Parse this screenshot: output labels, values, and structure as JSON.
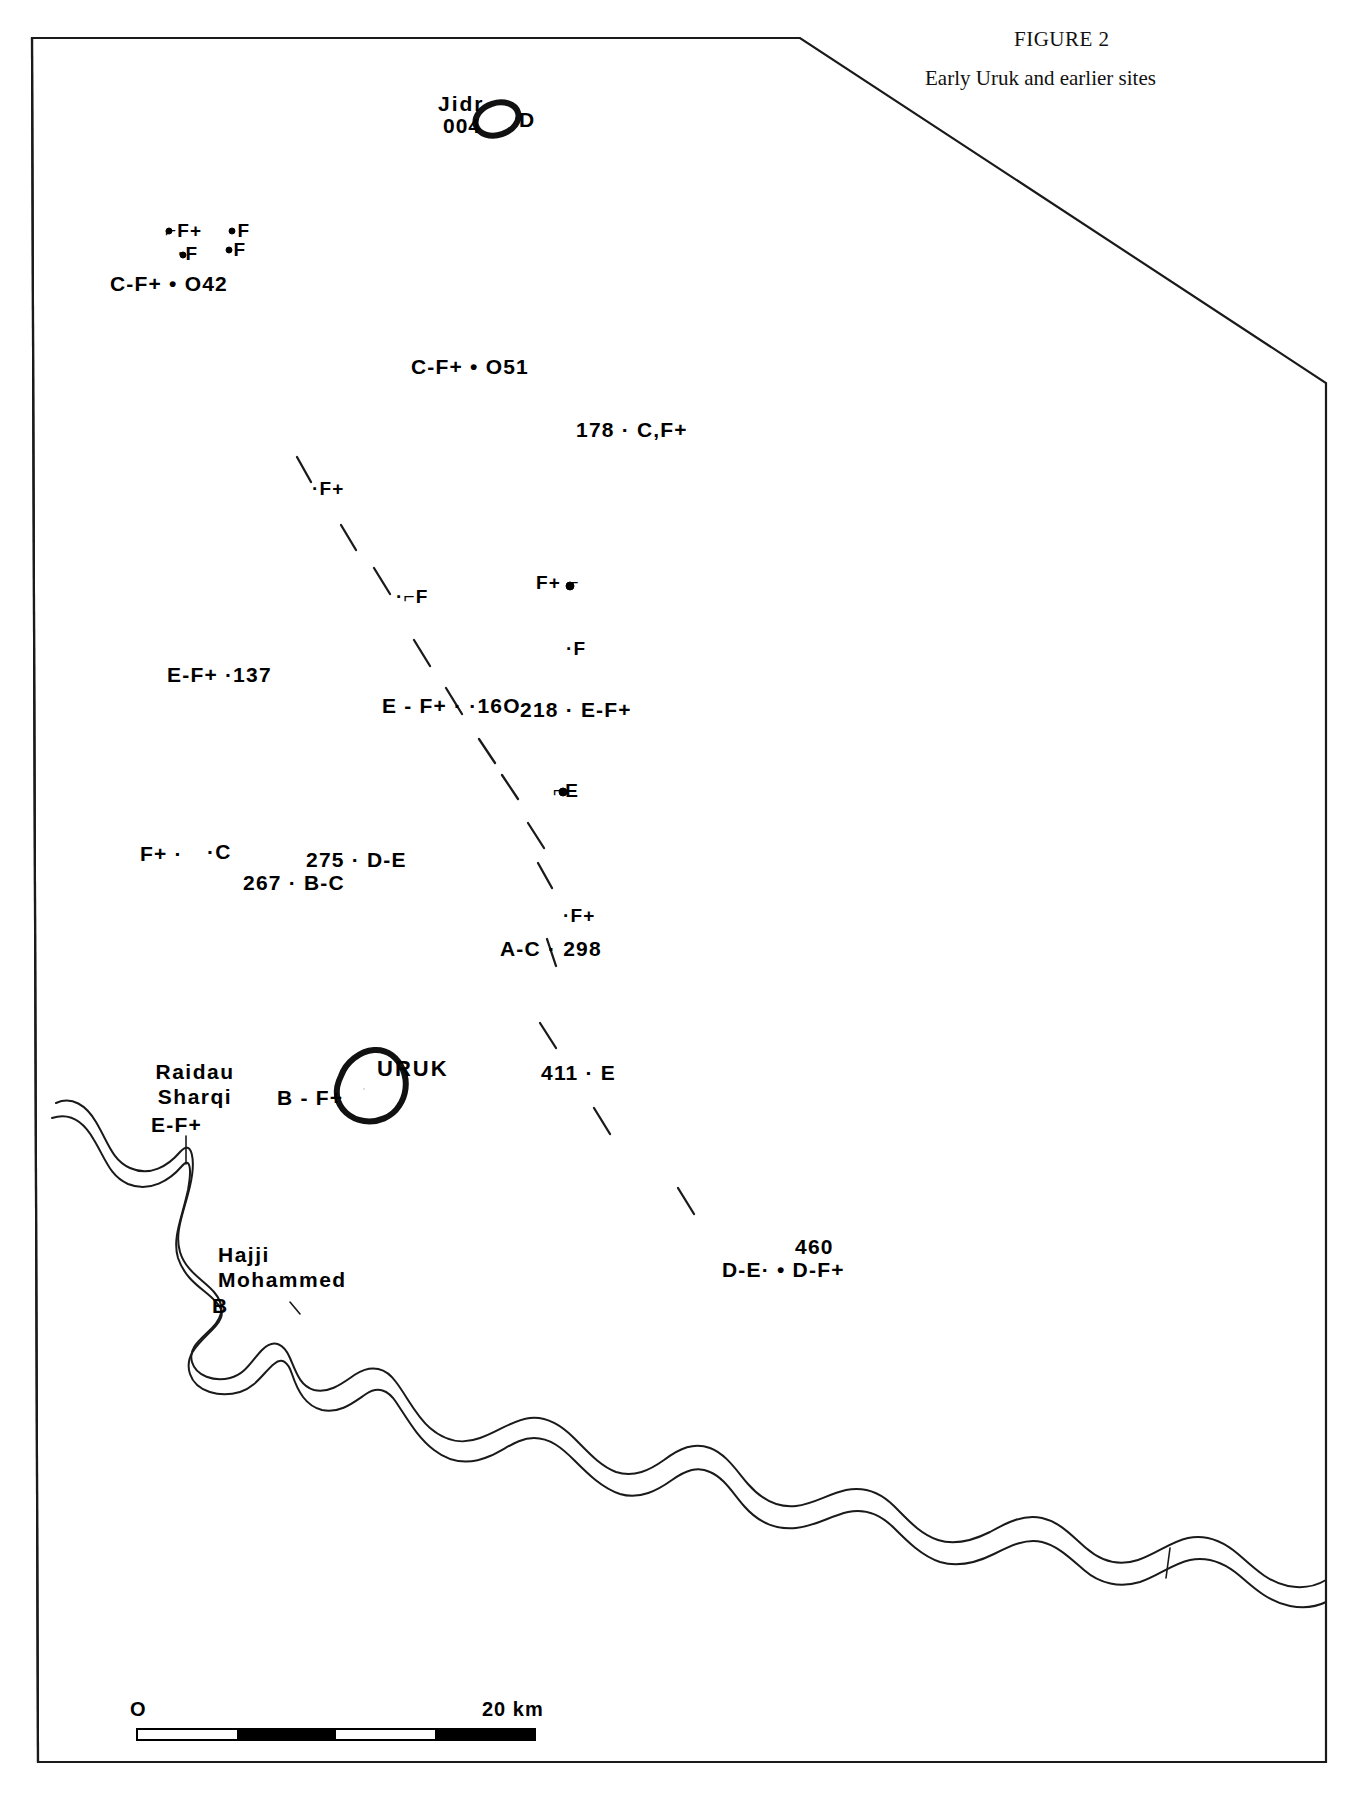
{
  "figure": {
    "number": "FIGURE 2",
    "caption": "Early Uruk and earlier sites"
  },
  "scale": {
    "zero_label": "O",
    "max_label": "20 km"
  },
  "labels": {
    "jidr_name": "Jidr",
    "jidr_number": "004",
    "jidr_period": "D",
    "f_cluster_1": "⌐F+",
    "f_cluster_2": "·F",
    "f_cluster_3": "·F",
    "f_cluster_4": "·F",
    "site_042": "C-F+ • O42",
    "site_051": "C-F+ • O51",
    "site_178": "178 · C,F+",
    "site_f_west": "·F+",
    "site_f_mid": "·⌐F",
    "site_f_plus_e": "F+ ⌐",
    "site_f_east": "·F",
    "site_137": "E-F+ ·137",
    "site_160": "E - F+ · ·16O",
    "site_218": "218 · E-F+",
    "site_e": "⌐E",
    "site_f_plus_west": "F+ ·",
    "site_c": "·C",
    "site_267": "267 · B-C",
    "site_275": "275 · D-E",
    "site_f_plus_lower": "·F+",
    "site_298": "A-C · 298",
    "uruk_name": "URUK",
    "uruk_period": "B - F+",
    "site_411": "411 · E",
    "raidau_name": "Raidau\nSharqi",
    "raidau_period": "E-F+",
    "hajji_name": "Hajji\nMohammed",
    "hajji_period": "B",
    "site_460_number": "460",
    "site_460": "D-E· • D-F+"
  }
}
